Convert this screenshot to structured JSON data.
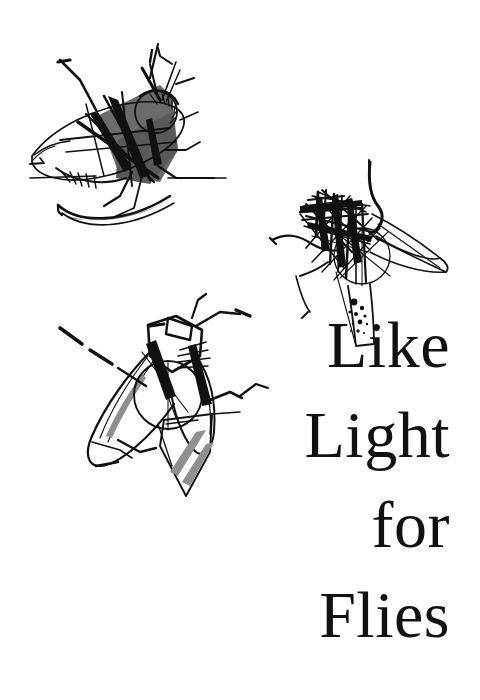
{
  "poster": {
    "canvas": {
      "width": 480,
      "height": 700
    },
    "background_color": "#ffffff",
    "ink_color": "#111111",
    "gray_fill_dark": "#6b6b6b",
    "gray_fill_light": "#8f8f8f"
  },
  "title": {
    "full_text": "Like Light for Flies",
    "alignment": "right",
    "lines": [
      {
        "text": "Like"
      },
      {
        "text": "Light"
      },
      {
        "text": "for"
      },
      {
        "text": "Flies"
      }
    ]
  },
  "illustrations": [
    {
      "name": "fly-top-left",
      "description": "Side-view fly with dark gray filled thorax, angular crossing ink strokes, hatched eye and crescent lower wing",
      "position": "top-left"
    },
    {
      "name": "fly-right",
      "description": "Dense scribbled fly of overlapping straight ink lines with a long curved antenna and speckled dots at the tail",
      "position": "middle-right"
    },
    {
      "name": "fly-bottom-left",
      "description": "Top-view fly with spread wings, round thorax and gray diagonal striped abdomen",
      "position": "bottom-left"
    }
  ]
}
